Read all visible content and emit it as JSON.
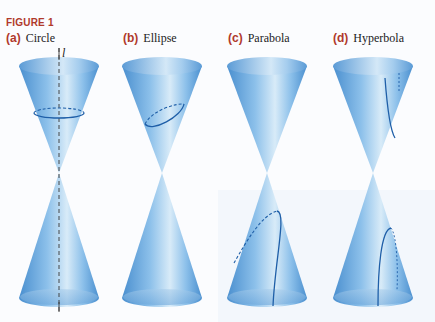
{
  "figure": {
    "label": "FIGURE 1",
    "axis_label": "l",
    "panels": [
      {
        "letter": "(a)",
        "name": "Circle",
        "section": "circle"
      },
      {
        "letter": "(b)",
        "name": "Ellipse",
        "section": "ellipse"
      },
      {
        "letter": "(c)",
        "name": "Parabola",
        "section": "parabola"
      },
      {
        "letter": "(d)",
        "name": "Hyperbola",
        "section": "hyperbola"
      }
    ]
  },
  "colors": {
    "label_red": "#b0392b",
    "cone_dark": "#4a8fcf",
    "cone_light": "#d8ebf8",
    "curve": "#1f5fa8"
  }
}
